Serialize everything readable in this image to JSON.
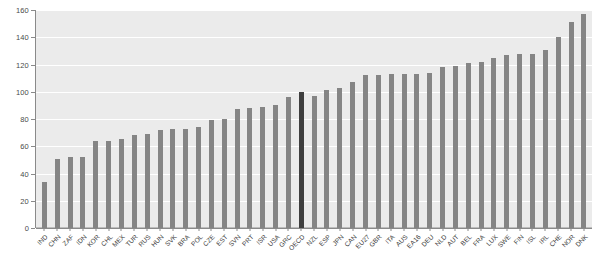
{
  "chart_data": {
    "type": "bar",
    "title": "",
    "subtitle": "",
    "xlabel": "",
    "ylabel": "",
    "ylim": [
      0,
      160
    ],
    "yticks": [
      0,
      20,
      40,
      60,
      80,
      100,
      120,
      140,
      160
    ],
    "grid": true,
    "legend": "none",
    "highlight_category": "OECD",
    "highlight_value": 100,
    "colors": {
      "bar": "#858585",
      "highlight_bar": "#3f3f3f",
      "plot_background": "#ebebeb",
      "gridline": "#ffffff",
      "axis": "#8a8a8a",
      "tick_label": "#3d3d3d",
      "page_background": "#ffffff"
    },
    "categories": [
      "IND",
      "CHN",
      "ZAF",
      "IDN",
      "KOR",
      "CHL",
      "MEX",
      "TUR",
      "RUS",
      "HUN",
      "SVK",
      "BRA",
      "POL",
      "CZE",
      "EST",
      "SVN",
      "PRT",
      "ISR",
      "USA",
      "GRC",
      "OECD",
      "NZL",
      "ESP",
      "JPN",
      "CAN",
      "EU27",
      "GBR",
      "ITA",
      "AUS",
      "EA16",
      "DEU",
      "NLD",
      "AUT",
      "BEL",
      "FRA",
      "LUX",
      "SWE",
      "FIN",
      "ISL",
      "IRL",
      "CHE",
      "NOR",
      "DNK"
    ],
    "values": [
      34,
      51,
      52,
      52,
      64,
      64,
      65,
      68,
      69,
      72,
      73,
      73,
      74,
      79,
      80,
      87,
      88,
      89,
      90,
      96,
      100,
      97,
      101,
      103,
      107,
      112,
      112,
      113,
      113,
      113,
      114,
      118,
      119,
      121,
      122,
      125,
      127,
      128,
      128,
      131,
      140,
      151,
      157
    ]
  }
}
